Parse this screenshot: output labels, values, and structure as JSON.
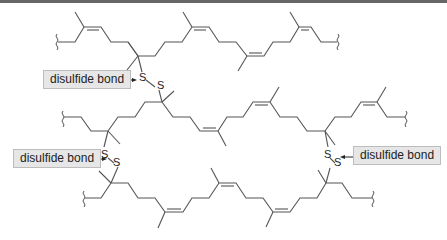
{
  "diagram": {
    "atom_label": "S",
    "annotations": [
      {
        "id": "top-left",
        "label": "disulfide bond"
      },
      {
        "id": "middle-left",
        "label": "disulfide bond"
      },
      {
        "id": "middle-right",
        "label": "disulfide bond"
      }
    ],
    "chains": [
      {
        "id": "top",
        "description": "polyisoprene chain with cis C=C double bonds, terminated by wavy bond ends"
      },
      {
        "id": "middle",
        "description": "polyisoprene chain cross-linked above and below"
      },
      {
        "id": "bottom",
        "description": "polyisoprene chain cross-linked to middle chain"
      }
    ],
    "colors": {
      "bond": "#555555",
      "label_bg": "#e6e6e6",
      "label_border": "#bdbdbd",
      "text": "#222222"
    }
  }
}
